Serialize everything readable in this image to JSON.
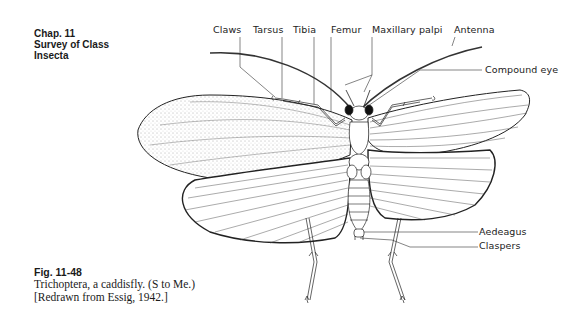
{
  "chapter": {
    "line1": "Chap. 11",
    "line2": "Survey of Class",
    "line3": "Insecta"
  },
  "figure": {
    "number": "Fig. 11-48",
    "caption_line1": "Trichoptera, a caddisfly. (S to Me.)",
    "caption_line2": "[Redrawn from Essig, 1942.]"
  },
  "labels": {
    "claws": "Claws",
    "tarsus": "Tarsus",
    "tibia": "Tibia",
    "femur": "Femur",
    "maxillary_palpi": "Maxillary palpi",
    "antenna": "Antenna",
    "compound_eye": "Compound eye",
    "aedeagus": "Aedeagus",
    "claspers": "Claspers"
  }
}
